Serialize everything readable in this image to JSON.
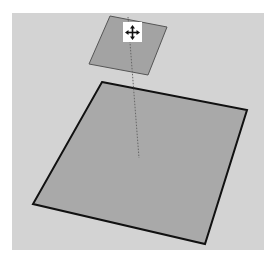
{
  "viewport": {
    "background": "#d3d3d3"
  },
  "scene": {
    "big_face": {
      "points": "102,82 247,110 205,244 33,204",
      "fill": "#a9a9a9",
      "stroke": "#111111"
    },
    "small_face": {
      "points": "110,16 167,27 148,75 89,64",
      "fill": "#a3a3a3",
      "stroke": "#555555"
    },
    "inference_line": {
      "x1": 128,
      "y1": 17,
      "x2": 139,
      "y2": 158,
      "stroke": "#666666"
    }
  },
  "cursor": {
    "icon": "move-icon",
    "color": "#111111"
  }
}
